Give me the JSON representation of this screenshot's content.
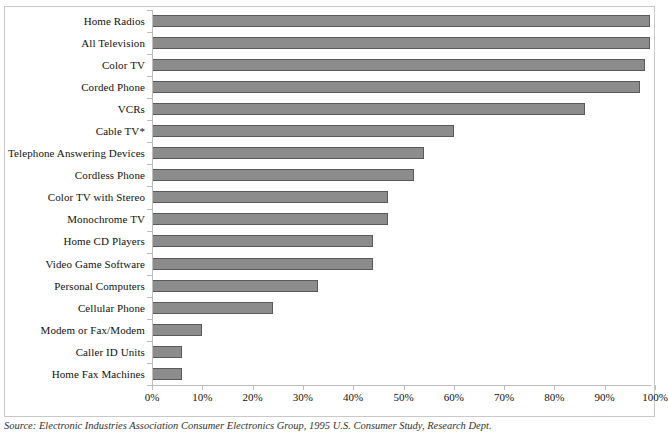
{
  "chart_data": {
    "type": "bar",
    "orientation": "horizontal",
    "title": "",
    "subtitle": "",
    "xlabel": "",
    "ylabel": "",
    "xlim": [
      0,
      100
    ],
    "xticks": [
      "0%",
      "10%",
      "20%",
      "30%",
      "40%",
      "50%",
      "60%",
      "70%",
      "80%",
      "90%",
      "100%"
    ],
    "xtick_values": [
      0,
      10,
      20,
      30,
      40,
      50,
      60,
      70,
      80,
      90,
      100
    ],
    "grid": false,
    "legend": "none",
    "bar_color": "#8c8c8c",
    "bar_border_color": "#5a5a5a",
    "axis_color": "#bdbdbd",
    "categories": [
      "Home Radios",
      "All Television",
      "Color TV",
      "Corded Phone",
      "VCRs",
      "Cable TV*",
      "Telephone Answering Devices",
      "Cordless Phone",
      "Color TV with Stereo",
      "Monochrome TV",
      "Home CD Players",
      "Video Game Software",
      "Personal Computers",
      "Cellular Phone",
      "Modem or Fax/Modem",
      "Caller ID Units",
      "Home Fax Machines"
    ],
    "values": [
      99,
      99,
      98,
      97,
      86,
      60,
      54,
      52,
      47,
      47,
      44,
      44,
      33,
      24,
      10,
      6,
      6
    ],
    "value_labels": [
      "99%",
      "99%",
      "98%",
      "97%",
      "86%",
      "60%",
      "54%",
      "52%",
      "47%",
      "47%",
      "44%",
      "44%",
      "33%",
      "24%",
      "10%",
      "6%",
      "6%"
    ]
  },
  "footnote": {
    "source_prefix": "Source:",
    "source_text": "Electronic Industries Association Consumer Electronics Group, 1995 U.S. Consumer Study, Research Dept."
  }
}
